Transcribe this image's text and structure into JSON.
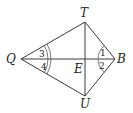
{
  "diagram": {
    "type": "geometry-kite",
    "points": {
      "T": {
        "label": "T",
        "x": 85,
        "y": 22
      },
      "Q": {
        "label": "Q",
        "x": 21,
        "y": 59
      },
      "B": {
        "label": "B",
        "x": 115,
        "y": 59
      },
      "U": {
        "label": "U",
        "x": 85,
        "y": 96
      },
      "E": {
        "label": "E",
        "x": 85,
        "y": 59
      }
    },
    "segments": [
      "QT",
      "TB",
      "BU",
      "UQ",
      "QB",
      "TU"
    ],
    "angles": [
      {
        "label": "1",
        "vertex": "B",
        "between": [
          "T",
          "E"
        ],
        "arcs": 1
      },
      {
        "label": "2",
        "vertex": "B",
        "between": [
          "E",
          "U"
        ],
        "arcs": 1
      },
      {
        "label": "3",
        "vertex": "Q",
        "between": [
          "T",
          "E"
        ],
        "arcs": 2
      },
      {
        "label": "4",
        "vertex": "Q",
        "between": [
          "E",
          "U"
        ],
        "arcs": 2
      }
    ]
  }
}
